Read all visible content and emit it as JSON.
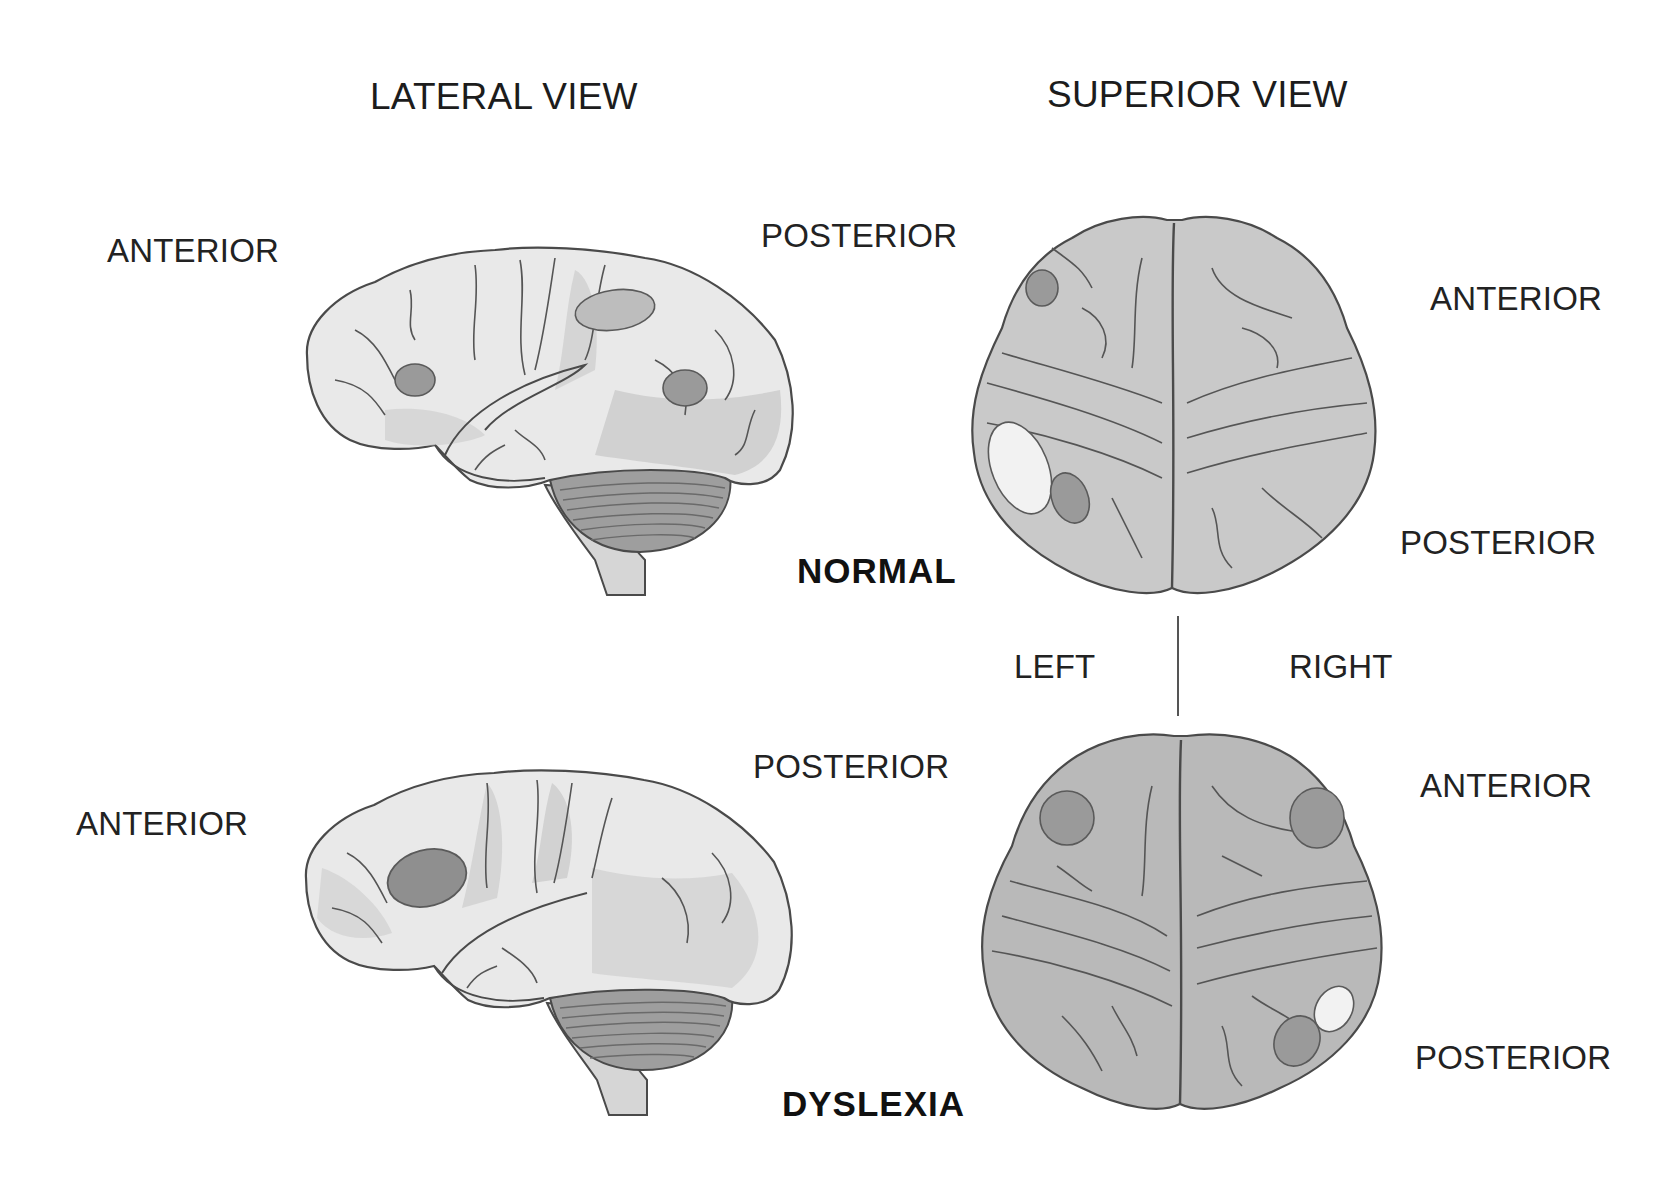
{
  "titles": {
    "lateral": "LATERAL VIEW",
    "superior": "SUPERIOR VIEW"
  },
  "normal": {
    "label": "NORMAL",
    "lateral": {
      "anterior": "ANTERIOR",
      "posterior": "POSTERIOR"
    },
    "superior": {
      "anterior": "ANTERIOR",
      "posterior": "POSTERIOR"
    }
  },
  "dyslexia": {
    "label": "DYSLEXIA",
    "lateral": {
      "anterior": "ANTERIOR",
      "posterior": "POSTERIOR"
    },
    "superior": {
      "anterior": "ANTERIOR",
      "posterior": "POSTERIOR"
    }
  },
  "hemispheres": {
    "left": "LEFT",
    "right": "RIGHT"
  },
  "colors": {
    "cortex_light": "#ececec",
    "cortex_mid": "#cfcfcf",
    "superior_normal": "#c9c9c9",
    "superior_dyslexia": "#b9b9b9",
    "spot_dark": "#9a9a9a",
    "spot_white": "#f2f2f2",
    "outline": "#4a4a4a"
  }
}
